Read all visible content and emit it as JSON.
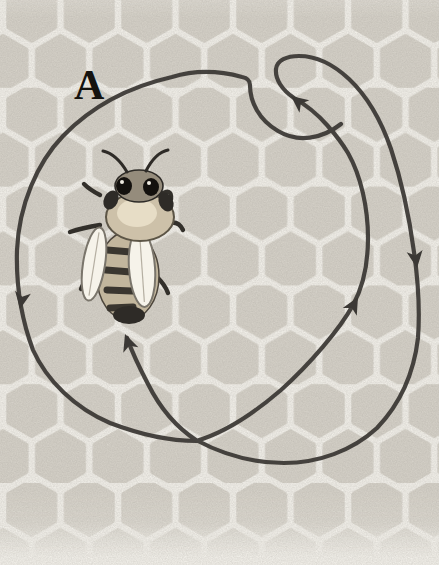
{
  "figure": {
    "panel_label": "A",
    "dance_path": {
      "description": "Closed circular dance path with reversal loop at top right, drawn over the comb around the bee",
      "arrows": [
        {
          "name": "arrow-left-down",
          "direction": "down"
        },
        {
          "name": "arrow-loop-end",
          "direction": "up-left"
        },
        {
          "name": "arrow-inner-up",
          "direction": "up"
        },
        {
          "name": "arrow-outer-down",
          "direction": "down"
        },
        {
          "name": "arrow-to-bee",
          "direction": "up-left toward bee tail"
        }
      ]
    },
    "colors": {
      "paper": "#f4f2ec",
      "comb_cell": "#d6d2c9",
      "dance_line": "#3b3834",
      "label": "#15130f",
      "bee_thorax": "#cdc1a9",
      "bee_wing": "#f6f3ea",
      "bee_dark": "#2e2b27"
    }
  }
}
